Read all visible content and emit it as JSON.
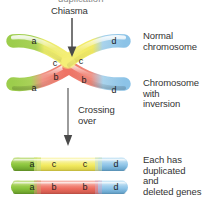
{
  "figure": {
    "title_cutoff": "duplication",
    "background": "#ffffff"
  },
  "annotations": {
    "chiasma": "Chiasma",
    "crossing_over": "Crossing\nover",
    "normal_chromosome": "Normal\nchromosome",
    "chromosome_with_inversion": "Chromosome\nwith\ninversion",
    "duplicated_deleted": "Each has\nduplicated\nand\ndeleted genes"
  },
  "gene_labels": {
    "a": "a",
    "b": "b",
    "c": "c",
    "d": "d"
  },
  "colors": {
    "green": "#8cc63f",
    "green_light": "#b5d96b",
    "green_dark": "#6aa52c",
    "yellow": "#f5ef7a",
    "yellow_deep": "#f2e94e",
    "red": "#ef6f62",
    "red_light": "#f4a196",
    "blue": "#8fc5e8",
    "blue_light": "#bcdcf2",
    "blue_dark": "#5ba4d4",
    "arrow": "#4a4a4a",
    "text": "#343434"
  },
  "crossed_pair": {
    "upper_left_arm": {
      "segments": [
        "a",
        "c"
      ],
      "gene_a": "a",
      "gene_c": "c"
    },
    "upper_right_arm": {
      "segments": [
        "c",
        "d"
      ],
      "gene_c": "c",
      "gene_d": "d"
    },
    "lower_left_arm": {
      "segments": [
        "a",
        "b"
      ],
      "gene_a": "a",
      "gene_b": "b"
    },
    "lower_right_arm": {
      "segments": [
        "b",
        "d"
      ],
      "gene_b": "b",
      "gene_d": "d"
    }
  },
  "products": [
    {
      "name": "product-chromosome-top",
      "segments": [
        {
          "gene": "a",
          "color": "#8cc63f"
        },
        {
          "gene": "c",
          "color": "#f5ef7a"
        },
        {
          "gene": "c",
          "color": "#f5ef7a"
        },
        {
          "gene": "d",
          "color": "#8fc5e8"
        }
      ]
    },
    {
      "name": "product-chromosome-bottom",
      "segments": [
        {
          "gene": "a",
          "color": "#8cc63f"
        },
        {
          "gene": "b",
          "color": "#ef6f62"
        },
        {
          "gene": "b",
          "color": "#ef6f62"
        },
        {
          "gene": "d",
          "color": "#8fc5e8"
        }
      ]
    }
  ]
}
